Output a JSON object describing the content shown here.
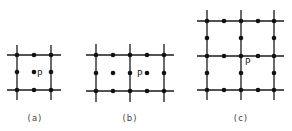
{
  "figure": {
    "panels": [
      {
        "id": "a",
        "caption": "(a)",
        "point_label": "P",
        "vlines": [
          17,
          51
        ],
        "hlines": [
          55,
          90
        ],
        "line_extent": {
          "x": [
            7,
            61
          ],
          "y": [
            45,
            100
          ]
        },
        "nodes": [
          [
            17,
            55
          ],
          [
            34,
            55
          ],
          [
            51,
            55
          ],
          [
            17,
            72
          ],
          [
            51,
            72
          ],
          [
            17,
            90
          ],
          [
            34,
            90
          ],
          [
            51,
            90
          ]
        ],
        "interior_points": [
          [
            34,
            72
          ]
        ],
        "p_pos": [
          37,
          77
        ],
        "caption_pos": [
          35,
          121
        ]
      },
      {
        "id": "b",
        "caption": "(b)",
        "point_label": "P",
        "vlines": [
          96,
          130,
          164
        ],
        "hlines": [
          55,
          91
        ],
        "line_extent": {
          "x": [
            86,
            174
          ],
          "y": [
            44,
            102
          ]
        },
        "nodes": [
          [
            96,
            55
          ],
          [
            113,
            55
          ],
          [
            130,
            55
          ],
          [
            147,
            55
          ],
          [
            164,
            55
          ],
          [
            96,
            73
          ],
          [
            130,
            73
          ],
          [
            164,
            73
          ],
          [
            96,
            91
          ],
          [
            113,
            91
          ],
          [
            130,
            91
          ],
          [
            147,
            91
          ],
          [
            164,
            91
          ]
        ],
        "interior_points": [
          [
            113,
            73
          ],
          [
            147,
            73
          ]
        ],
        "p_pos": [
          137,
          77
        ],
        "caption_pos": [
          130,
          121
        ]
      },
      {
        "id": "c",
        "caption": "(c)",
        "point_label": "P",
        "vlines": [
          207,
          241,
          274
        ],
        "hlines": [
          21,
          56,
          90
        ],
        "line_extent": {
          "x": [
            197,
            284
          ],
          "y": [
            10,
            100
          ]
        },
        "nodes": [
          [
            207,
            21
          ],
          [
            224,
            21
          ],
          [
            241,
            21
          ],
          [
            258,
            21
          ],
          [
            274,
            21
          ],
          [
            207,
            38
          ],
          [
            241,
            38
          ],
          [
            274,
            38
          ],
          [
            207,
            56
          ],
          [
            224,
            56
          ],
          [
            241,
            56
          ],
          [
            258,
            56
          ],
          [
            274,
            56
          ],
          [
            207,
            73
          ],
          [
            241,
            73
          ],
          [
            274,
            73
          ],
          [
            207,
            90
          ],
          [
            224,
            90
          ],
          [
            241,
            90
          ],
          [
            258,
            90
          ],
          [
            274,
            90
          ]
        ],
        "interior_points": [],
        "p_pos": [
          245,
          65
        ],
        "caption_pos": [
          241,
          121
        ]
      }
    ]
  }
}
